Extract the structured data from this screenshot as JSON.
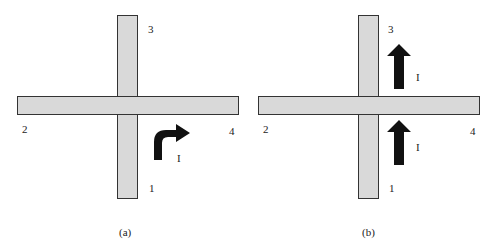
{
  "figure": {
    "road_color": "#d9d9d9",
    "road_border_color": "#333333",
    "arrow_color": "#111111",
    "panels": [
      {
        "id": "a",
        "caption": "(a)",
        "approach_labels": {
          "south": "1",
          "west": "2",
          "north": "3",
          "east": "4"
        },
        "arrows": [
          {
            "type": "right-turn",
            "label": "I",
            "position": "south-east quadrant, turning from approach 1 toward 4"
          }
        ]
      },
      {
        "id": "b",
        "caption": "(b)",
        "approach_labels": {
          "south": "1",
          "west": "2",
          "north": "3",
          "east": "4"
        },
        "arrows": [
          {
            "type": "straight-up",
            "label": "I",
            "position": "north-east quadrant, beyond intersection"
          },
          {
            "type": "straight-up",
            "label": "I",
            "position": "south-east quadrant, before intersection"
          }
        ]
      }
    ]
  }
}
